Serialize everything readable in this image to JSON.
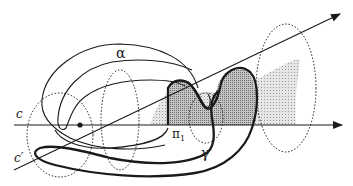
{
  "figure": {
    "labels": {
      "alpha": "α",
      "c": "c",
      "c_prime": "c′",
      "pi": "π",
      "pi_sub": "1",
      "gamma": "γ"
    },
    "colors": {
      "stroke": "#1a1a1a",
      "shade_light": "#d8d8d8",
      "shade_dark": "#a8a8a8",
      "background": "#ffffff"
    }
  }
}
